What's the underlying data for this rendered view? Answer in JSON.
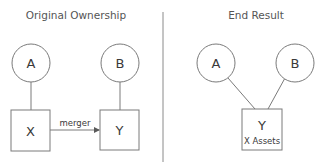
{
  "panels": {
    "left": {
      "title": "Original Ownership",
      "owners": [
        {
          "label": "A",
          "owns": "X"
        },
        {
          "label": "B",
          "owns": "Y"
        }
      ],
      "companies": [
        {
          "label": "X"
        },
        {
          "label": "Y"
        }
      ],
      "transaction": {
        "label": "merger",
        "from": "X",
        "to": "Y"
      }
    },
    "right": {
      "title": "End Result",
      "owners": [
        {
          "label": "A",
          "owns": "Y"
        },
        {
          "label": "B",
          "owns": "Y"
        }
      ],
      "company": {
        "label": "Y",
        "sublabel": "X Assets"
      }
    }
  },
  "colors": {
    "stroke": "#7a7a7a",
    "text": "#3a3a3a",
    "background": "#ffffff"
  }
}
